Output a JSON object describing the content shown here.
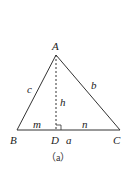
{
  "figure": {
    "caption": "（a）",
    "vertices": {
      "A": {
        "label": "A",
        "x": 56,
        "y": 55
      },
      "B": {
        "label": "B",
        "x": 17,
        "y": 130
      },
      "C": {
        "label": "C",
        "x": 120,
        "y": 130
      },
      "D": {
        "label": "D",
        "x": 56,
        "y": 130
      }
    },
    "sides": {
      "c": "c",
      "b": "b",
      "a": "a",
      "h": "h",
      "m": "m",
      "n": "n"
    },
    "colors": {
      "line": "#333333",
      "text": "#222222"
    }
  }
}
